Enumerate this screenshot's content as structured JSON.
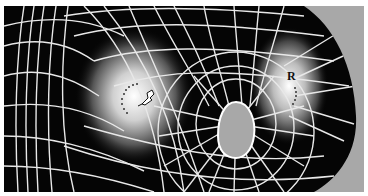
{
  "figure": {
    "background_color": "#a8a8a8",
    "surface_color": "#050505",
    "mesh_line_color": "#e8e8e8",
    "highlight_color": "#ffffff",
    "labels": {
      "right_marker": "R",
      "left_marker_icon": "arrow-cursor-icon"
    }
  }
}
